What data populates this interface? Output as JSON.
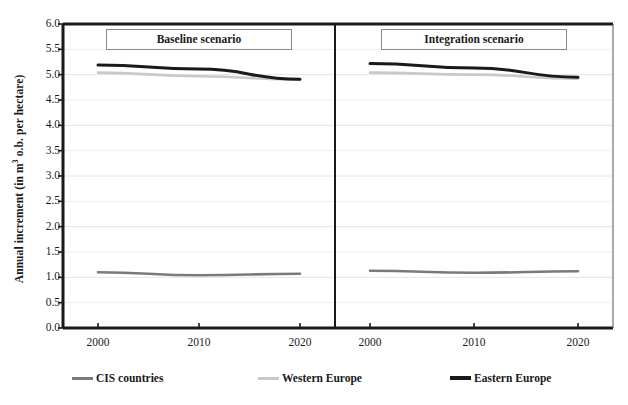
{
  "chart_data": {
    "type": "line",
    "title": "",
    "xlabel": "",
    "ylabel": "Annual increment (in m3 o.b. per hectare)",
    "ylabel_prefix": "Annual increment (in m",
    "ylabel_sup": "3",
    "ylabel_suffix": " o.b. per hectare)",
    "ylim": [
      0.0,
      6.0
    ],
    "ytick_step": 0.5,
    "yticks": [
      "6.0",
      "5.5",
      "5.0",
      "4.5",
      "4.0",
      "3.5",
      "3.0",
      "2.5",
      "2.0",
      "1.5",
      "1.0",
      "0.5",
      "0.0"
    ],
    "grid": true,
    "grid_axis": "y",
    "legend_position": "bottom",
    "x": [
      2000,
      2010,
      2020
    ],
    "categories": [
      "2000",
      "2010",
      "2020"
    ],
    "panels": [
      {
        "name": "baseline",
        "title": "Baseline scenario",
        "xticks": [
          "2000",
          "2010",
          "2020"
        ],
        "series": [
          {
            "name": "Eastern Europe",
            "color": "#1a1a1a",
            "width": 3.0,
            "values": [
              5.19,
              5.11,
              4.91
            ]
          },
          {
            "name": "Western Europe",
            "color": "#c9c9c9",
            "width": 2.6,
            "values": [
              5.04,
              4.97,
              4.9
            ]
          },
          {
            "name": "CIS countries",
            "color": "#7a7a7a",
            "width": 2.6,
            "values": [
              1.1,
              1.04,
              1.07
            ]
          }
        ]
      },
      {
        "name": "integration",
        "title": "Integration scenario",
        "xticks": [
          "2000",
          "2010",
          "2020"
        ],
        "series": [
          {
            "name": "Eastern Europe",
            "color": "#1a1a1a",
            "width": 3.0,
            "values": [
              5.22,
              5.13,
              4.95
            ]
          },
          {
            "name": "Western Europe",
            "color": "#c9c9c9",
            "width": 2.6,
            "values": [
              5.04,
              5.0,
              4.92
            ]
          },
          {
            "name": "CIS countries",
            "color": "#7a7a7a",
            "width": 2.6,
            "values": [
              1.13,
              1.09,
              1.12
            ]
          }
        ]
      }
    ],
    "legend": [
      {
        "label": "CIS countries",
        "color": "#7a7a7a"
      },
      {
        "label": "Western Europe",
        "color": "#c9c9c9"
      },
      {
        "label": "Eastern Europe",
        "color": "#1a1a1a"
      }
    ]
  },
  "layout": {
    "plot_left": 63,
    "plot_right": 613,
    "plot_top": 24,
    "plot_bottom": 328,
    "divider_x": 335,
    "panel_pad": 18
  }
}
